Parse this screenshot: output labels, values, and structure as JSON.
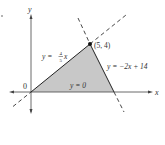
{
  "diagram": {
    "title": "",
    "axes": {
      "x_label": "x",
      "y_label": "y",
      "origin_label": "0"
    },
    "lines": [
      {
        "label": "y = 4/5 x",
        "label_prefix": "y = ",
        "frac_num": "4",
        "frac_den": "5",
        "label_suffix": "x",
        "style": "dashed"
      },
      {
        "label": "y = −2x + 14",
        "style": "dashed"
      },
      {
        "label": "y = 0",
        "style": "solid"
      }
    ],
    "vertex": {
      "label": "(5, 4)",
      "x": 5,
      "y": 4
    },
    "region": {
      "description": "Triangle bounded by y = 4/5 x, y = −2x + 14, y = 0",
      "vertices": [
        [
          0,
          0
        ],
        [
          5,
          4
        ],
        [
          7,
          0
        ]
      ],
      "fill": "#c8c8c8"
    },
    "colors": {
      "axis": "#333333",
      "line": "#222222",
      "fill": "#c8c8c8"
    }
  }
}
